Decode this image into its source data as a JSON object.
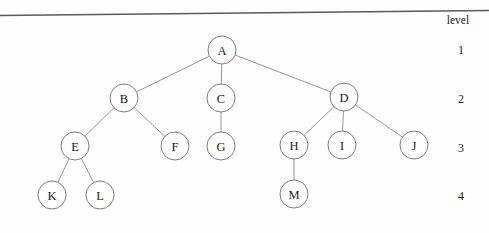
{
  "figure": {
    "background_color": "#fefefe",
    "node_fill": "#ffffff",
    "node_stroke": "#6e6e6e",
    "edge_color": "#8a8a8a",
    "text_color": "#1a1a1a",
    "node_radius": 14
  },
  "top_rule": {
    "name": "scan-artifact-line",
    "x1": 0,
    "y1": 15.5,
    "x2": 489,
    "y2": 10.5,
    "color": "#5a5a5a"
  },
  "level_axis": {
    "caption": "level",
    "caption_x": 458,
    "caption_y": 24,
    "levels": [
      {
        "label": "1",
        "x": 461,
        "y": 50
      },
      {
        "label": "2",
        "x": 461,
        "y": 99
      },
      {
        "label": "3",
        "x": 461,
        "y": 148
      },
      {
        "label": "4",
        "x": 461,
        "y": 196
      }
    ]
  },
  "chart_data": {
    "type": "diagram",
    "subtype": "rooted-tree",
    "title": "",
    "root": "A",
    "depth": 4,
    "node_count": 13,
    "edge_count": 12,
    "nodes": [
      {
        "id": "A",
        "label": "A",
        "level": 1,
        "x": 222,
        "y": 50
      },
      {
        "id": "B",
        "label": "B",
        "level": 2,
        "x": 124,
        "y": 98
      },
      {
        "id": "C",
        "label": "C",
        "level": 2,
        "x": 221,
        "y": 98
      },
      {
        "id": "D",
        "label": "D",
        "level": 2,
        "x": 344,
        "y": 97
      },
      {
        "id": "E",
        "label": "E",
        "level": 3,
        "x": 75,
        "y": 146
      },
      {
        "id": "F",
        "label": "F",
        "level": 3,
        "x": 175,
        "y": 146
      },
      {
        "id": "G",
        "label": "G",
        "level": 3,
        "x": 221,
        "y": 146
      },
      {
        "id": "H",
        "label": "H",
        "level": 3,
        "x": 294,
        "y": 145
      },
      {
        "id": "I",
        "label": "I",
        "level": 3,
        "x": 342,
        "y": 145
      },
      {
        "id": "J",
        "label": "J",
        "level": 3,
        "x": 414,
        "y": 145
      },
      {
        "id": "K",
        "label": "K",
        "level": 4,
        "x": 52,
        "y": 195
      },
      {
        "id": "L",
        "label": "L",
        "level": 4,
        "x": 100,
        "y": 195
      },
      {
        "id": "M",
        "label": "M",
        "level": 4,
        "x": 294,
        "y": 194
      }
    ],
    "edges": [
      {
        "from": "A",
        "to": "B"
      },
      {
        "from": "A",
        "to": "C"
      },
      {
        "from": "A",
        "to": "D"
      },
      {
        "from": "B",
        "to": "E"
      },
      {
        "from": "B",
        "to": "F"
      },
      {
        "from": "C",
        "to": "G"
      },
      {
        "from": "D",
        "to": "H"
      },
      {
        "from": "D",
        "to": "I"
      },
      {
        "from": "D",
        "to": "J"
      },
      {
        "from": "E",
        "to": "K"
      },
      {
        "from": "E",
        "to": "L"
      },
      {
        "from": "H",
        "to": "M"
      }
    ]
  }
}
